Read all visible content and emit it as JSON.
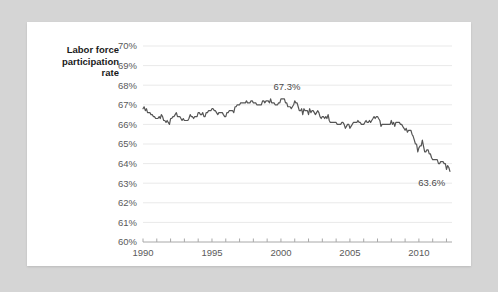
{
  "card": {
    "background": "#ffffff",
    "page_background": "#d5d5d5"
  },
  "chart_data": {
    "type": "line",
    "title": "",
    "ylabel": "Labor force participation rate",
    "xlabel": "",
    "ylim": [
      60,
      70
    ],
    "xlim": [
      1990,
      2012.4
    ],
    "grid": true,
    "legend": null,
    "line_color": "#555555",
    "gridline_color": "#e9e9e9",
    "axis_color": "#a8a8a8",
    "ytick_labels": [
      "60%",
      "61%",
      "62%",
      "63%",
      "64%",
      "65%",
      "66%",
      "67%",
      "68%",
      "69%",
      "70%"
    ],
    "ytick_values": [
      60,
      61,
      62,
      63,
      64,
      65,
      66,
      67,
      68,
      69,
      70
    ],
    "xtick_labels": [
      "1990",
      "1995",
      "2000",
      "2005",
      "2010"
    ],
    "xtick_values": [
      1990,
      1995,
      2000,
      2005,
      2010
    ],
    "xtick_minor_values": [
      1990,
      1991,
      1992,
      1993,
      1994,
      1995,
      1996,
      1997,
      1998,
      1999,
      2000,
      2001,
      2002,
      2003,
      2004,
      2005,
      2006,
      2007,
      2008,
      2009,
      2010,
      2011,
      2012
    ],
    "annotations": [
      {
        "label": "67.3%",
        "x": 2000.0,
        "y": 67.3
      },
      {
        "label": "63.6%",
        "x": 2012.2,
        "y": 63.6
      }
    ],
    "series": [
      {
        "name": "Labor force participation rate",
        "x": [
          1990.0,
          1990.08,
          1990.17,
          1990.25,
          1990.33,
          1990.42,
          1990.5,
          1990.58,
          1990.67,
          1990.75,
          1990.83,
          1990.92,
          1991.0,
          1991.08,
          1991.17,
          1991.25,
          1991.33,
          1991.42,
          1991.5,
          1991.58,
          1991.67,
          1991.75,
          1991.83,
          1991.92,
          1992.0,
          1992.08,
          1992.17,
          1992.25,
          1992.33,
          1992.42,
          1992.5,
          1992.58,
          1992.67,
          1992.75,
          1992.83,
          1992.92,
          1993.0,
          1993.08,
          1993.17,
          1993.25,
          1993.33,
          1993.42,
          1993.5,
          1993.58,
          1993.67,
          1993.75,
          1993.83,
          1993.92,
          1994.0,
          1994.08,
          1994.17,
          1994.25,
          1994.33,
          1994.42,
          1994.5,
          1994.58,
          1994.67,
          1994.75,
          1994.83,
          1994.92,
          1995.0,
          1995.08,
          1995.17,
          1995.25,
          1995.33,
          1995.42,
          1995.5,
          1995.58,
          1995.67,
          1995.75,
          1995.83,
          1995.92,
          1996.0,
          1996.08,
          1996.17,
          1996.25,
          1996.33,
          1996.42,
          1996.5,
          1996.58,
          1996.67,
          1996.75,
          1996.83,
          1996.92,
          1997.0,
          1997.08,
          1997.17,
          1997.25,
          1997.33,
          1997.42,
          1997.5,
          1997.58,
          1997.67,
          1997.75,
          1997.83,
          1997.92,
          1998.0,
          1998.08,
          1998.17,
          1998.25,
          1998.33,
          1998.42,
          1998.5,
          1998.58,
          1998.67,
          1998.75,
          1998.83,
          1998.92,
          1999.0,
          1999.08,
          1999.17,
          1999.25,
          1999.33,
          1999.42,
          1999.5,
          1999.58,
          1999.67,
          1999.75,
          1999.83,
          1999.92,
          2000.0,
          2000.08,
          2000.17,
          2000.25,
          2000.33,
          2000.42,
          2000.5,
          2000.58,
          2000.67,
          2000.75,
          2000.83,
          2000.92,
          2001.0,
          2001.08,
          2001.17,
          2001.25,
          2001.33,
          2001.42,
          2001.5,
          2001.58,
          2001.67,
          2001.75,
          2001.83,
          2001.92,
          2002.0,
          2002.08,
          2002.17,
          2002.25,
          2002.33,
          2002.42,
          2002.5,
          2002.58,
          2002.67,
          2002.75,
          2002.83,
          2002.92,
          2003.0,
          2003.08,
          2003.17,
          2003.25,
          2003.33,
          2003.42,
          2003.5,
          2003.58,
          2003.67,
          2003.75,
          2003.83,
          2003.92,
          2004.0,
          2004.08,
          2004.17,
          2004.25,
          2004.33,
          2004.42,
          2004.5,
          2004.58,
          2004.67,
          2004.75,
          2004.83,
          2004.92,
          2005.0,
          2005.08,
          2005.17,
          2005.25,
          2005.33,
          2005.42,
          2005.5,
          2005.58,
          2005.67,
          2005.75,
          2005.83,
          2005.92,
          2006.0,
          2006.08,
          2006.17,
          2006.25,
          2006.33,
          2006.42,
          2006.5,
          2006.58,
          2006.67,
          2006.75,
          2006.83,
          2006.92,
          2007.0,
          2007.08,
          2007.17,
          2007.25,
          2007.33,
          2007.42,
          2007.5,
          2007.58,
          2007.67,
          2007.75,
          2007.83,
          2007.92,
          2008.0,
          2008.08,
          2008.17,
          2008.25,
          2008.33,
          2008.42,
          2008.5,
          2008.58,
          2008.67,
          2008.75,
          2008.83,
          2008.92,
          2009.0,
          2009.08,
          2009.17,
          2009.25,
          2009.33,
          2009.42,
          2009.5,
          2009.58,
          2009.67,
          2009.75,
          2009.83,
          2009.92,
          2010.0,
          2010.08,
          2010.17,
          2010.25,
          2010.33,
          2010.42,
          2010.5,
          2010.58,
          2010.67,
          2010.75,
          2010.83,
          2010.92,
          2011.0,
          2011.08,
          2011.17,
          2011.25,
          2011.33,
          2011.42,
          2011.5,
          2011.58,
          2011.67,
          2011.75,
          2011.83,
          2011.92,
          2012.0,
          2012.08,
          2012.17,
          2012.25
        ],
        "values": [
          66.8,
          66.9,
          66.7,
          66.8,
          66.6,
          66.6,
          66.6,
          66.5,
          66.5,
          66.4,
          66.4,
          66.3,
          66.3,
          66.3,
          66.4,
          66.3,
          66.5,
          66.4,
          66.2,
          66.2,
          66.1,
          66.2,
          66.1,
          66.0,
          66.3,
          66.3,
          66.4,
          66.4,
          66.5,
          66.6,
          66.4,
          66.4,
          66.4,
          66.3,
          66.2,
          66.3,
          66.2,
          66.2,
          66.2,
          66.2,
          66.3,
          66.5,
          66.4,
          66.4,
          66.3,
          66.4,
          66.4,
          66.4,
          66.6,
          66.6,
          66.5,
          66.5,
          66.6,
          66.4,
          66.4,
          66.6,
          66.6,
          66.7,
          66.7,
          66.7,
          66.8,
          66.8,
          66.7,
          66.7,
          66.6,
          66.5,
          66.6,
          66.6,
          66.6,
          66.6,
          66.5,
          66.4,
          66.4,
          66.6,
          66.6,
          66.7,
          66.7,
          66.7,
          66.7,
          66.6,
          66.9,
          66.9,
          67.0,
          67.0,
          67.0,
          67.1,
          67.1,
          67.1,
          67.1,
          67.1,
          67.2,
          67.1,
          67.1,
          67.1,
          67.2,
          67.2,
          67.1,
          67.1,
          67.1,
          67.0,
          67.0,
          67.0,
          67.0,
          67.0,
          67.2,
          67.2,
          67.1,
          67.2,
          67.2,
          67.2,
          67.1,
          67.3,
          67.1,
          67.1,
          67.1,
          67.0,
          67.0,
          67.0,
          67.1,
          67.1,
          67.3,
          67.3,
          67.3,
          67.3,
          67.1,
          67.1,
          66.9,
          66.9,
          66.9,
          66.8,
          66.9,
          67.0,
          67.2,
          67.1,
          67.1,
          66.9,
          66.7,
          66.7,
          66.8,
          66.5,
          66.8,
          66.7,
          66.7,
          66.7,
          66.5,
          66.8,
          66.6,
          66.7,
          66.7,
          66.6,
          66.5,
          66.6,
          66.7,
          66.6,
          66.4,
          66.3,
          66.4,
          66.4,
          66.3,
          66.4,
          66.3,
          66.5,
          66.2,
          66.1,
          66.1,
          66.1,
          66.1,
          66.1,
          66.1,
          66.0,
          66.0,
          66.0,
          66.0,
          66.1,
          66.1,
          66.0,
          65.8,
          65.9,
          66.0,
          66.0,
          65.8,
          65.9,
          66.0,
          66.1,
          66.1,
          66.1,
          66.1,
          66.2,
          66.1,
          66.1,
          66.0,
          66.0,
          66.0,
          66.1,
          66.2,
          66.1,
          66.1,
          66.2,
          66.1,
          66.2,
          66.3,
          66.4,
          66.3,
          66.4,
          66.4,
          66.3,
          66.2,
          65.9,
          66.0,
          66.0,
          66.0,
          66.0,
          66.0,
          66.0,
          66.0,
          66.0,
          66.2,
          66.0,
          66.1,
          65.9,
          66.1,
          66.1,
          66.1,
          66.1,
          66.0,
          66.0,
          65.9,
          65.8,
          65.7,
          65.8,
          65.6,
          65.7,
          65.7,
          65.7,
          65.5,
          65.4,
          65.2,
          65.0,
          65.0,
          64.6,
          64.8,
          64.9,
          64.9,
          65.2,
          64.9,
          64.6,
          64.6,
          64.7,
          64.7,
          64.5,
          64.5,
          64.3,
          64.2,
          64.2,
          64.2,
          64.2,
          64.2,
          64.0,
          64.0,
          64.1,
          64.1,
          64.1,
          64.0,
          64.0,
          63.7,
          63.9,
          63.8,
          63.6
        ]
      }
    ]
  }
}
